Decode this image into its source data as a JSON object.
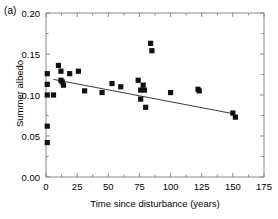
{
  "figure": {
    "panel_label": "(a)"
  },
  "chart_data": {
    "type": "scatter",
    "title": "",
    "xlabel": "Time since disturbance (years)",
    "ylabel": "Summer albedo",
    "xlim": [
      0,
      175
    ],
    "ylim": [
      0.0,
      0.2
    ],
    "xticks": [
      0,
      25,
      50,
      75,
      100,
      125,
      150,
      175
    ],
    "xtick_labels": [
      "0",
      "25",
      "50",
      "75",
      "100",
      "125",
      "150",
      "175"
    ],
    "yticks": [
      0.0,
      0.05,
      0.1,
      0.15,
      0.2
    ],
    "ytick_labels": [
      "0.00",
      "0.05",
      "0.10",
      "0.15",
      "0.20"
    ],
    "x_minor_tick_step": 12.5,
    "y_minor_tick_step": 0.025,
    "grid": false,
    "legend": null,
    "marker": "square",
    "marker_color": "#111111",
    "points": [
      {
        "x": 1,
        "y": 0.126
      },
      {
        "x": 1,
        "y": 0.113
      },
      {
        "x": 1,
        "y": 0.1
      },
      {
        "x": 1,
        "y": 0.062
      },
      {
        "x": 1,
        "y": 0.042
      },
      {
        "x": 6,
        "y": 0.1
      },
      {
        "x": 10,
        "y": 0.136
      },
      {
        "x": 12,
        "y": 0.129
      },
      {
        "x": 12,
        "y": 0.118
      },
      {
        "x": 13,
        "y": 0.116
      },
      {
        "x": 14,
        "y": 0.112
      },
      {
        "x": 19,
        "y": 0.126
      },
      {
        "x": 26,
        "y": 0.129
      },
      {
        "x": 31,
        "y": 0.105
      },
      {
        "x": 45,
        "y": 0.103
      },
      {
        "x": 53,
        "y": 0.114
      },
      {
        "x": 60,
        "y": 0.11
      },
      {
        "x": 74,
        "y": 0.118
      },
      {
        "x": 76,
        "y": 0.106
      },
      {
        "x": 76,
        "y": 0.095
      },
      {
        "x": 78,
        "y": 0.112
      },
      {
        "x": 79,
        "y": 0.106
      },
      {
        "x": 80,
        "y": 0.085
      },
      {
        "x": 84,
        "y": 0.163
      },
      {
        "x": 85,
        "y": 0.154
      },
      {
        "x": 100,
        "y": 0.103
      },
      {
        "x": 122,
        "y": 0.107
      },
      {
        "x": 123,
        "y": 0.105
      },
      {
        "x": 150,
        "y": 0.078
      },
      {
        "x": 152,
        "y": 0.073
      }
    ],
    "fit_line": {
      "x_start": 6,
      "y_start": 0.119,
      "x_end": 151,
      "y_end": 0.077
    }
  }
}
